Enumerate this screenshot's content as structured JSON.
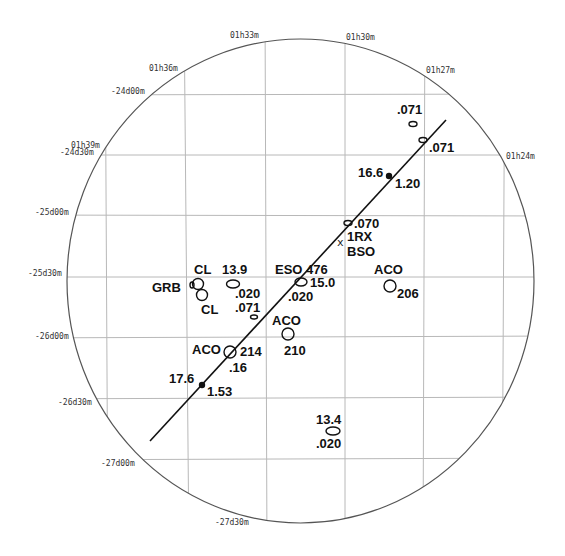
{
  "figure": {
    "type": "sky-map",
    "ra_labels": [
      {
        "text": "01h39m",
        "x": 71,
        "y": 148
      },
      {
        "text": "01h36m",
        "x": 149,
        "y": 71
      },
      {
        "text": "01h33m",
        "x": 230,
        "y": 38
      },
      {
        "text": "01h30m",
        "x": 346,
        "y": 40
      },
      {
        "text": "01h27m",
        "x": 426,
        "y": 73
      },
      {
        "text": "01h24m",
        "x": 506,
        "y": 159
      }
    ],
    "dec_labels": [
      {
        "text": "-24d00m",
        "x": 111,
        "y": 94
      },
      {
        "text": "-24d30m",
        "x": 60,
        "y": 155
      },
      {
        "text": "-25d00m",
        "x": 35,
        "y": 215
      },
      {
        "text": "-25d30m",
        "x": 28,
        "y": 276
      },
      {
        "text": "-26d00m",
        "x": 35,
        "y": 339
      },
      {
        "text": "-26d30m",
        "x": 58,
        "y": 405
      },
      {
        "text": "-27d00m",
        "x": 101,
        "y": 466
      },
      {
        "text": "-27d30m",
        "x": 215,
        "y": 525
      }
    ],
    "sources": [
      {
        "name": "src-071-top",
        "cx": 413,
        "cy": 124,
        "rx": 4,
        "ry": 2.5
      },
      {
        "name": "src-071-line",
        "cx": 423,
        "cy": 140,
        "rx": 4,
        "ry": 2.5
      },
      {
        "name": "src-070",
        "cx": 348,
        "cy": 223,
        "rx": 4,
        "ry": 2.5
      },
      {
        "name": "src-eso476",
        "cx": 301,
        "cy": 282,
        "rx": 6,
        "ry": 4
      },
      {
        "name": "src-aco206",
        "cx": 390,
        "cy": 286,
        "rx": 6,
        "ry": 6
      },
      {
        "name": "src-cl-upper",
        "cx": 198,
        "cy": 284,
        "rx": 5.5,
        "ry": 5.5
      },
      {
        "name": "src-cl-lower",
        "cx": 202,
        "cy": 295,
        "rx": 5.5,
        "ry": 5.5
      },
      {
        "name": "src-grb",
        "cx": 192,
        "cy": 285,
        "rx": 2,
        "ry": 3
      },
      {
        "name": "src-13-9",
        "cx": 233,
        "cy": 284,
        "rx": 6.5,
        "ry": 4
      },
      {
        "name": "src-071-small",
        "cx": 254,
        "cy": 317,
        "rx": 3.5,
        "ry": 2
      },
      {
        "name": "src-aco210",
        "cx": 288,
        "cy": 334,
        "rx": 6,
        "ry": 6
      },
      {
        "name": "src-aco214",
        "cx": 230,
        "cy": 352,
        "rx": 6,
        "ry": 6
      },
      {
        "name": "src-13-4",
        "cx": 333,
        "cy": 431,
        "rx": 7,
        "ry": 4
      }
    ],
    "markers": [
      {
        "name": "dot-16-6",
        "cx": 389,
        "cy": 176
      },
      {
        "name": "dot-17-6",
        "cx": 202,
        "cy": 385
      }
    ],
    "cross": {
      "label": "x",
      "x": 340,
      "y": 242
    },
    "track": {
      "x1": 150,
      "y1": 441,
      "x2": 446,
      "y2": 120
    },
    "labels": [
      {
        "text": ".071",
        "x": 397,
        "y": 114
      },
      {
        "text": ".071",
        "x": 429,
        "y": 152
      },
      {
        "text": "16.6",
        "x": 358,
        "y": 177
      },
      {
        "text": "1.20",
        "x": 395,
        "y": 188
      },
      {
        "text": ".070",
        "x": 354,
        "y": 228
      },
      {
        "text": "1RX",
        "x": 347,
        "y": 241
      },
      {
        "text": "BSO",
        "x": 347,
        "y": 256
      },
      {
        "text": "ACO",
        "x": 374,
        "y": 274
      },
      {
        "text": "206",
        "x": 397,
        "y": 298
      },
      {
        "text": "ESO 476",
        "x": 275,
        "y": 274
      },
      {
        "text": "15.0",
        "x": 310,
        "y": 287
      },
      {
        "text": ".020",
        "x": 288,
        "y": 301
      },
      {
        "text": "CL",
        "x": 194,
        "y": 274
      },
      {
        "text": "GRB",
        "x": 152,
        "y": 292
      },
      {
        "text": "CL",
        "x": 201,
        "y": 314
      },
      {
        "text": "13.9",
        "x": 222,
        "y": 274
      },
      {
        "text": ".020",
        "x": 235,
        "y": 298
      },
      {
        "text": ".071",
        "x": 235,
        "y": 312
      },
      {
        "text": "ACO",
        "x": 272,
        "y": 325
      },
      {
        "text": "210",
        "x": 284,
        "y": 355
      },
      {
        "text": "ACO",
        "x": 192,
        "y": 354
      },
      {
        "text": "214",
        "x": 240,
        "y": 356
      },
      {
        "text": ".16",
        "x": 229,
        "y": 372
      },
      {
        "text": "17.6",
        "x": 169,
        "y": 383
      },
      {
        "text": "1.53",
        "x": 207,
        "y": 396
      },
      {
        "text": "13.4",
        "x": 316,
        "y": 424
      },
      {
        "text": ".020",
        "x": 316,
        "y": 448
      }
    ]
  }
}
